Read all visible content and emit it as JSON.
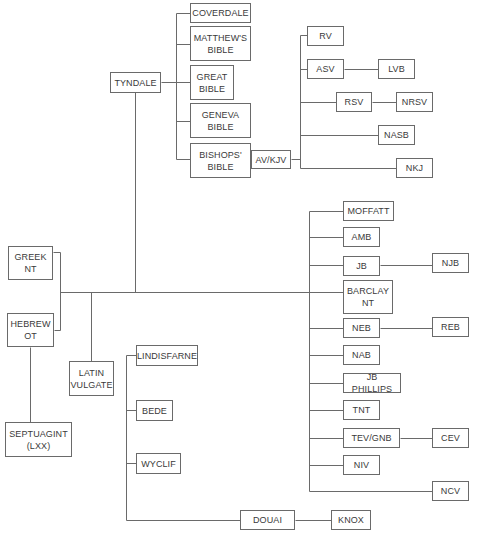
{
  "diagram": {
    "type": "family-tree",
    "colors": {
      "line": "#6a6a6a",
      "box_border": "#6a6a6a",
      "text": "#3a3a3a",
      "background": "#ffffff"
    },
    "nodes": [
      {
        "id": "greek_nt",
        "label": "GREEK\nNT",
        "x": 8,
        "y": 246,
        "w": 45,
        "h": 34
      },
      {
        "id": "hebrew_ot",
        "label": "HEBREW\nOT",
        "x": 7,
        "y": 313,
        "w": 47,
        "h": 34
      },
      {
        "id": "latin_vulgate",
        "label": "LATIN\nVULGATE",
        "x": 69,
        "y": 361,
        "w": 45,
        "h": 35
      },
      {
        "id": "septuagint",
        "label": "SEPTUAGINT\n(LXX)",
        "x": 5,
        "y": 422,
        "w": 67,
        "h": 35
      },
      {
        "id": "tyndale",
        "label": "TYNDALE",
        "x": 110,
        "y": 72,
        "w": 51,
        "h": 21
      },
      {
        "id": "coverdale",
        "label": "COVERDALE",
        "x": 190,
        "y": 3,
        "w": 61,
        "h": 20
      },
      {
        "id": "matthews_bible",
        "label": "MATTHEW'S\nBIBLE",
        "x": 190,
        "y": 26,
        "w": 61,
        "h": 35
      },
      {
        "id": "great_bible",
        "label": "GREAT\nBIBLE",
        "x": 190,
        "y": 65,
        "w": 44,
        "h": 35
      },
      {
        "id": "geneva_bible",
        "label": "GENEVA\nBIBLE",
        "x": 190,
        "y": 103,
        "w": 61,
        "h": 35
      },
      {
        "id": "bishops_bible",
        "label": "BISHOPS'\nBIBLE",
        "x": 190,
        "y": 143,
        "w": 61,
        "h": 35
      },
      {
        "id": "av_kjv",
        "label": "AV/KJV",
        "x": 251,
        "y": 150,
        "w": 40,
        "h": 19
      },
      {
        "id": "rv",
        "label": "RV",
        "x": 307,
        "y": 26,
        "w": 37,
        "h": 20
      },
      {
        "id": "asv",
        "label": "ASV",
        "x": 307,
        "y": 59,
        "w": 37,
        "h": 20
      },
      {
        "id": "lvb",
        "label": "LVB",
        "x": 378,
        "y": 59,
        "w": 37,
        "h": 20
      },
      {
        "id": "rsv",
        "label": "RSV",
        "x": 336,
        "y": 92,
        "w": 36,
        "h": 20
      },
      {
        "id": "nrsv",
        "label": "NRSV",
        "x": 396,
        "y": 92,
        "w": 37,
        "h": 20
      },
      {
        "id": "nasb",
        "label": "NASB",
        "x": 378,
        "y": 125,
        "w": 37,
        "h": 20
      },
      {
        "id": "nkj",
        "label": "NKJ",
        "x": 396,
        "y": 158,
        "w": 37,
        "h": 20
      },
      {
        "id": "moffatt",
        "label": "MOFFATT",
        "x": 343,
        "y": 201,
        "w": 51,
        "h": 20
      },
      {
        "id": "amb",
        "label": "AMB",
        "x": 343,
        "y": 227,
        "w": 37,
        "h": 20
      },
      {
        "id": "jb",
        "label": "JB",
        "x": 343,
        "y": 256,
        "w": 37,
        "h": 20
      },
      {
        "id": "njb",
        "label": "NJB",
        "x": 432,
        "y": 253,
        "w": 37,
        "h": 20
      },
      {
        "id": "barclay_nt",
        "label": "BARCLAY\nNT",
        "x": 343,
        "y": 280,
        "w": 50,
        "h": 34
      },
      {
        "id": "neb",
        "label": "NEB",
        "x": 343,
        "y": 318,
        "w": 37,
        "h": 20
      },
      {
        "id": "reb",
        "label": "REB",
        "x": 432,
        "y": 317,
        "w": 37,
        "h": 20
      },
      {
        "id": "nab",
        "label": "NAB",
        "x": 343,
        "y": 345,
        "w": 37,
        "h": 20
      },
      {
        "id": "jb_phillips",
        "label": "JB PHILLIPS",
        "x": 343,
        "y": 373,
        "w": 58,
        "h": 20
      },
      {
        "id": "tnt",
        "label": "TNT",
        "x": 343,
        "y": 400,
        "w": 37,
        "h": 20
      },
      {
        "id": "tev_gnb",
        "label": "TEV/GNB",
        "x": 343,
        "y": 428,
        "w": 57,
        "h": 20
      },
      {
        "id": "cev",
        "label": "CEV",
        "x": 432,
        "y": 428,
        "w": 37,
        "h": 20
      },
      {
        "id": "niv",
        "label": "NIV",
        "x": 343,
        "y": 455,
        "w": 37,
        "h": 20
      },
      {
        "id": "ncv",
        "label": "NCV",
        "x": 432,
        "y": 481,
        "w": 37,
        "h": 20
      },
      {
        "id": "lindisfarne",
        "label": "LINDISFARNE",
        "x": 136,
        "y": 345,
        "w": 62,
        "h": 21
      },
      {
        "id": "bede",
        "label": "BEDE",
        "x": 136,
        "y": 400,
        "w": 37,
        "h": 21
      },
      {
        "id": "wyclif",
        "label": "WYCLIF",
        "x": 136,
        "y": 453,
        "w": 45,
        "h": 21
      },
      {
        "id": "douai",
        "label": "DOUAI",
        "x": 240,
        "y": 510,
        "w": 55,
        "h": 20
      },
      {
        "id": "knox",
        "label": "KNOX",
        "x": 331,
        "y": 510,
        "w": 40,
        "h": 20
      }
    ],
    "edges": [
      {
        "from": "greek_nt",
        "to": "trunk"
      },
      {
        "from": "hebrew_ot",
        "to": "trunk"
      },
      {
        "from": "hebrew_ot",
        "to": "septuagint"
      },
      {
        "from": "trunk",
        "to": "latin_vulgate"
      },
      {
        "from": "trunk",
        "to": "tyndale"
      },
      {
        "from": "trunk",
        "to": "moffatt"
      },
      {
        "from": "trunk",
        "to": "amb"
      },
      {
        "from": "trunk",
        "to": "jb"
      },
      {
        "from": "trunk",
        "to": "barclay_nt"
      },
      {
        "from": "trunk",
        "to": "neb"
      },
      {
        "from": "trunk",
        "to": "nab"
      },
      {
        "from": "trunk",
        "to": "jb_phillips"
      },
      {
        "from": "trunk",
        "to": "tnt"
      },
      {
        "from": "trunk",
        "to": "tev_gnb"
      },
      {
        "from": "trunk",
        "to": "niv"
      },
      {
        "from": "trunk",
        "to": "ncv"
      },
      {
        "from": "jb",
        "to": "njb"
      },
      {
        "from": "neb",
        "to": "reb"
      },
      {
        "from": "tev_gnb",
        "to": "cev"
      },
      {
        "from": "tyndale",
        "to": "coverdale"
      },
      {
        "from": "tyndale",
        "to": "matthews_bible"
      },
      {
        "from": "tyndale",
        "to": "great_bible"
      },
      {
        "from": "tyndale",
        "to": "geneva_bible"
      },
      {
        "from": "tyndale",
        "to": "bishops_bible"
      },
      {
        "from": "bishops_bible",
        "to": "av_kjv"
      },
      {
        "from": "av_kjv",
        "to": "rv"
      },
      {
        "from": "av_kjv",
        "to": "asv"
      },
      {
        "from": "av_kjv",
        "to": "rsv"
      },
      {
        "from": "av_kjv",
        "to": "nasb"
      },
      {
        "from": "av_kjv",
        "to": "nkj"
      },
      {
        "from": "asv",
        "to": "lvb"
      },
      {
        "from": "rsv",
        "to": "nrsv"
      },
      {
        "from": "latin_vulgate",
        "to": "lindisfarne"
      },
      {
        "from": "latin_vulgate",
        "to": "bede"
      },
      {
        "from": "latin_vulgate",
        "to": "wyclif"
      },
      {
        "from": "latin_vulgate",
        "to": "douai"
      },
      {
        "from": "douai",
        "to": "knox"
      }
    ],
    "line_segments": [
      [
        53,
        252,
        60,
        252
      ],
      [
        60,
        252,
        60,
        330
      ],
      [
        54,
        330,
        60,
        330
      ],
      [
        60,
        292,
        338,
        292
      ],
      [
        30,
        347,
        30,
        422
      ],
      [
        91,
        292,
        91,
        361
      ],
      [
        135,
        92,
        135,
        292
      ],
      [
        161,
        82,
        176,
        82
      ],
      [
        176,
        13,
        176,
        159
      ],
      [
        176,
        13,
        190,
        13
      ],
      [
        176,
        44,
        190,
        44
      ],
      [
        176,
        82,
        190,
        82
      ],
      [
        176,
        121,
        190,
        121
      ],
      [
        176,
        159,
        190,
        159
      ],
      [
        251,
        159,
        251,
        159
      ],
      [
        291,
        159,
        300,
        159
      ],
      [
        300,
        35,
        300,
        168
      ],
      [
        300,
        35,
        307,
        35
      ],
      [
        300,
        69,
        307,
        69
      ],
      [
        300,
        102,
        336,
        102
      ],
      [
        300,
        135,
        378,
        135
      ],
      [
        300,
        168,
        396,
        168
      ],
      [
        344,
        69,
        378,
        69
      ],
      [
        372,
        102,
        396,
        102
      ],
      [
        309,
        211,
        309,
        491
      ],
      [
        309,
        211,
        343,
        211
      ],
      [
        309,
        237,
        343,
        237
      ],
      [
        309,
        265,
        343,
        265
      ],
      [
        309,
        292,
        343,
        292
      ],
      [
        309,
        328,
        343,
        328
      ],
      [
        309,
        355,
        343,
        355
      ],
      [
        309,
        383,
        343,
        383
      ],
      [
        309,
        410,
        343,
        410
      ],
      [
        309,
        438,
        343,
        438
      ],
      [
        309,
        465,
        343,
        465
      ],
      [
        309,
        491,
        432,
        491
      ],
      [
        380,
        265,
        432,
        265
      ],
      [
        380,
        328,
        432,
        328
      ],
      [
        400,
        438,
        432,
        438
      ],
      [
        126,
        355,
        126,
        520
      ],
      [
        126,
        355,
        136,
        355
      ],
      [
        126,
        410,
        136,
        410
      ],
      [
        126,
        463,
        136,
        463
      ],
      [
        126,
        520,
        240,
        520
      ],
      [
        295,
        520,
        331,
        520
      ]
    ]
  }
}
